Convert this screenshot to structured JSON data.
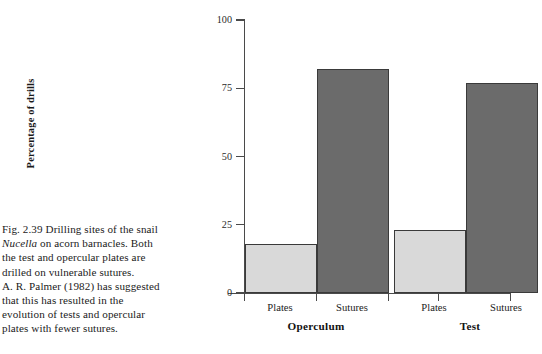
{
  "figure": {
    "caption_lines": [
      "Fig. 2.39  Drilling sites of the snail",
      "Nucella on acorn barnacles. Both",
      "the test and opercular plates are",
      "drilled on vulnerable sutures.",
      "A. R. Palmer (1982) has suggested",
      "that this has resulted in the",
      "evolution of tests and opercular",
      "plates with fewer sutures."
    ],
    "caption_number": "Fig. 2.39",
    "caption_italic_term": "Nucella"
  },
  "chart_data": {
    "type": "bar",
    "title": "",
    "xlabel": "",
    "ylabel": "Percentage of drills",
    "ylim": [
      0,
      100
    ],
    "yticks": [
      0,
      25,
      50,
      75,
      100
    ],
    "ytick_labels": [
      "0",
      "25",
      "50",
      "75",
      "100"
    ],
    "grid": false,
    "legend": "none",
    "groups": [
      {
        "name": "Operculum",
        "categories": [
          "Plates",
          "Sutures"
        ],
        "values": [
          18,
          82
        ]
      },
      {
        "name": "Test",
        "categories": [
          "Plates",
          "Sutures"
        ],
        "values": [
          23,
          77
        ]
      }
    ],
    "bars": [
      {
        "group": "Operculum",
        "category": "Plates",
        "value": 18,
        "color": "#d9d9d9"
      },
      {
        "group": "Operculum",
        "category": "Sutures",
        "value": 82,
        "color": "#6b6b6b"
      },
      {
        "group": "Test",
        "category": "Plates",
        "value": 23,
        "color": "#d9d9d9"
      },
      {
        "group": "Test",
        "category": "Sutures",
        "value": 77,
        "color": "#6b6b6b"
      }
    ],
    "colors": {
      "plates_bar": "#d9d9d9",
      "sutures_bar": "#6b6b6b",
      "axis": "#4a4a4a",
      "bar_outline": "#3a3a3a",
      "background": "#ffffff",
      "text": "#1a1a1a"
    }
  }
}
